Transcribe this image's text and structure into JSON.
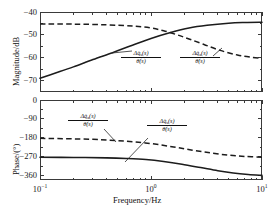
{
  "chart_data": [
    {
      "type": "line",
      "title": "",
      "panel": "magnitude",
      "xlabel": "",
      "ylabel": "Magnitude/dB",
      "xscale": "log",
      "xlim": [
        0.1,
        10
      ],
      "ylim": [
        -75,
        -40
      ],
      "yticks": [
        -40,
        -50,
        -60,
        -70
      ],
      "ytick_labels": [
        "−40",
        "−50",
        "−60",
        "−70"
      ],
      "xticks": [
        0.1,
        1,
        10
      ],
      "xtick_labels": [
        "10−1",
        "100",
        "101"
      ],
      "grid": false,
      "legend": "annotations",
      "series": [
        {
          "name": "Δq̇_s(s)/θ̇(s)",
          "style": "solid",
          "x": [
            0.1,
            0.14,
            0.2,
            0.3,
            0.45,
            0.65,
            1.0,
            1.5,
            2.2,
            3.2,
            5.0,
            7.0,
            10.0
          ],
          "y": [
            -69.0,
            -66.6,
            -64.0,
            -60.8,
            -57.8,
            -54.9,
            -51.6,
            -49.0,
            -47.0,
            -45.8,
            -44.9,
            -44.6,
            -44.5
          ]
        },
        {
          "name": "Δq̇_a(s)/θ̇(s)",
          "style": "dashed",
          "x": [
            0.1,
            0.2,
            0.4,
            0.7,
            1.0,
            1.3,
            1.7,
            2.2,
            3.0,
            4.2,
            6.0,
            8.0,
            10.0
          ],
          "y": [
            -45.2,
            -45.3,
            -45.6,
            -46.2,
            -47.0,
            -48.2,
            -49.9,
            -51.8,
            -54.2,
            -56.8,
            -58.8,
            -59.8,
            -60.3
          ]
        }
      ],
      "annotations": [
        {
          "label_num": "Δq̇",
          "label_sub": "s",
          "label_num_tail": "(s)",
          "label_den": "θ̇(s)"
        },
        {
          "label_num": "Δq̇",
          "label_sub": "a",
          "label_num_tail": "(s)",
          "label_den": "θ̇(s)"
        }
      ]
    },
    {
      "type": "line",
      "title": "",
      "panel": "phase",
      "xlabel": "Frequency/Hz",
      "ylabel": "Phase/(°)",
      "xscale": "log",
      "xlim": [
        0.1,
        10
      ],
      "ylim": [
        -380,
        0
      ],
      "yticks": [
        0,
        -90,
        -180,
        -270,
        -360
      ],
      "ytick_labels": [
        "0",
        "−90",
        "−180",
        "−270",
        "−360"
      ],
      "xticks": [
        0.1,
        1,
        10
      ],
      "xtick_labels": [
        "10−1",
        "100",
        "101"
      ],
      "grid": false,
      "legend": "annotations",
      "series": [
        {
          "name": "Δq̇_s(s)/θ̇(s)",
          "style": "solid",
          "x": [
            0.1,
            0.2,
            0.4,
            0.6,
            0.9,
            1.3,
            1.9,
            2.8,
            4.0,
            5.5,
            7.5,
            10.0
          ],
          "y": [
            -272.0,
            -273.0,
            -275.0,
            -278.0,
            -283.0,
            -292.0,
            -305.0,
            -321.0,
            -336.0,
            -347.0,
            -354.0,
            -358.0
          ]
        },
        {
          "name": "Δq̇_a(s)/θ̇(s)",
          "style": "dashed",
          "x": [
            0.1,
            0.3,
            0.6,
            1.0,
            1.6,
            2.4,
            3.5,
            5.0,
            7.0,
            10.0
          ],
          "y": [
            -182.0,
            -187.0,
            -196.0,
            -207.0,
            -223.0,
            -239.0,
            -252.0,
            -262.0,
            -268.0,
            -272.0
          ]
        }
      ],
      "annotations": [
        {
          "label_num": "Δq̇",
          "label_sub": "a",
          "label_num_tail": "(s)",
          "label_den": "θ̇(s)"
        },
        {
          "label_num": "Δq̇",
          "label_sub": "s",
          "label_num_tail": "(s)",
          "label_den": "θ̇(s)"
        }
      ]
    }
  ]
}
